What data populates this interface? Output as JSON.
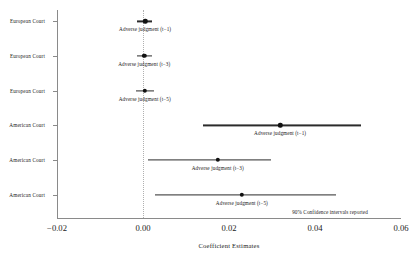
{
  "chart_data": {
    "type": "scatter",
    "title": "",
    "xlabel": "Coefficient Estimates",
    "ylabel": "",
    "xlim": [
      -0.02,
      0.06
    ],
    "xticks": [
      -0.02,
      0.0,
      0.02,
      0.04,
      0.06
    ],
    "xticklabels": [
      "−0.02",
      "0.00",
      "0.02",
      "0.04",
      "0.06"
    ],
    "grid": false,
    "zero_reference_line": 0.0,
    "legend_position": "none",
    "annotation": "90% Confidence intervals reported",
    "confidence_level": "90%",
    "categories": [
      "European Court",
      "European Court",
      "European Court",
      "American Court",
      "American Court",
      "American Court"
    ],
    "points": [
      {
        "group": "European Court",
        "label": "Adverse judgment (t−1)",
        "estimate": 0.0005,
        "ci_low": -0.0013,
        "ci_high": 0.0022
      },
      {
        "group": "European Court",
        "label": "Adverse judgment (t−3)",
        "estimate": 0.0003,
        "ci_low": -0.0015,
        "ci_high": 0.0021
      },
      {
        "group": "European Court",
        "label": "Adverse judgment (t−5)",
        "estimate": 0.0004,
        "ci_low": -0.0017,
        "ci_high": 0.0026
      },
      {
        "group": "American Court",
        "label": "Adverse judgment (t−1)",
        "estimate": 0.0319,
        "ci_low": 0.014,
        "ci_high": 0.0508
      },
      {
        "group": "American Court",
        "label": "Adverse judgment (t−3)",
        "estimate": 0.0174,
        "ci_low": 0.0012,
        "ci_high": 0.0298
      },
      {
        "group": "American Court",
        "label": "Adverse judgment (t−5)",
        "estimate": 0.023,
        "ci_low": 0.0029,
        "ci_high": 0.0448
      }
    ]
  },
  "colors": {
    "point": "#111111",
    "interval": "#2b2b2b",
    "axis": "#8a8a8a",
    "zero_line": "#b0b0b0",
    "background": "#ffffff",
    "text": "#1a1a1a"
  }
}
